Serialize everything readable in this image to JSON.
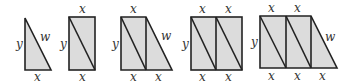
{
  "figure": {
    "colors": {
      "fill": "#dcdcdc",
      "stroke": "#222222",
      "label": "#333333"
    },
    "shapes": [
      {
        "id": "triangle",
        "labels": {
          "left": "y",
          "hyp": "w",
          "bottom": [
            "x"
          ]
        }
      },
      {
        "id": "rectangle-1",
        "labels": {
          "top": [
            "x"
          ],
          "left": "y",
          "bottom": [
            "x"
          ]
        }
      },
      {
        "id": "trapezoid-1",
        "labels": {
          "top": [
            "x"
          ],
          "left": "y",
          "hyp": "w",
          "bottom": [
            "x",
            "x"
          ]
        }
      },
      {
        "id": "rectangle-2",
        "labels": {
          "top": [
            "x",
            "x"
          ],
          "left": "y",
          "bottom": [
            "x",
            "x"
          ]
        }
      },
      {
        "id": "trapezoid-2",
        "labels": {
          "top": [
            "x",
            "x"
          ],
          "left": "y",
          "hyp": "w",
          "bottom": [
            "x",
            "x",
            "x"
          ]
        }
      }
    ]
  }
}
